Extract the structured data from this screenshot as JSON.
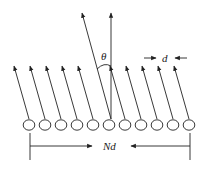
{
  "diagram": {
    "element_count": 11,
    "labels": {
      "angle": "θ",
      "spacing": "d",
      "aperture": "Nd"
    },
    "colors": {
      "stroke": "#222222",
      "background": "#ffffff"
    }
  }
}
